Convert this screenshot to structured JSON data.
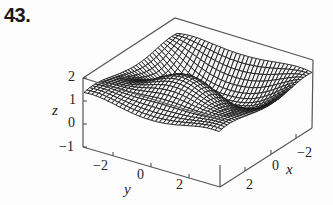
{
  "figure": {
    "number_label": "43."
  },
  "chart_data": {
    "type": "surface3d",
    "title": "",
    "render": "wireframe mesh surface inside bounding box",
    "axes": {
      "x": {
        "label": "x",
        "ticks": [
          "2",
          "0",
          "−2"
        ],
        "range": [
          -3,
          3
        ]
      },
      "y": {
        "label": "y",
        "ticks": [
          "−2",
          "0",
          "2"
        ],
        "range": [
          -3,
          3
        ]
      },
      "z": {
        "label": "z",
        "ticks": [
          "2",
          "1",
          "0",
          "−1"
        ],
        "range": [
          -1,
          2
        ]
      }
    },
    "surface_description": "oscillating surface with ridges and valleys; values roughly between -1 and 2",
    "colors": {
      "mesh": "#1a1a1a",
      "box": "#555555",
      "background": "#fdfdfd"
    }
  }
}
